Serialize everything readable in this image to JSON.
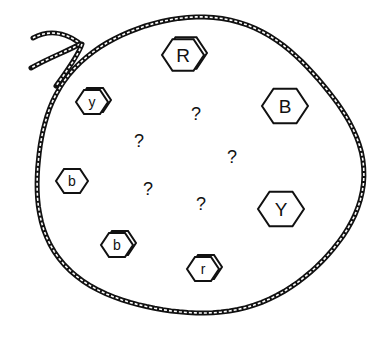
{
  "scene": {
    "title": "Bag of hexagonal tokens",
    "background": "#ffffff",
    "ink": "#111111"
  },
  "rope": {
    "color": "#111111",
    "highlight": "#ffffff",
    "center": [
      196,
      168
    ],
    "rx": 163,
    "ry": 148
  },
  "tokens": [
    {
      "id": "R",
      "label": "R",
      "x": 183,
      "y": 55,
      "size": 21,
      "double_edge": true,
      "font_size": 19
    },
    {
      "id": "y",
      "label": "y",
      "x": 92,
      "y": 102,
      "size": 16,
      "double_edge": true,
      "font_size": 14
    },
    {
      "id": "B",
      "label": "B",
      "x": 285,
      "y": 106,
      "size": 23,
      "double_edge": false,
      "font_size": 19
    },
    {
      "id": "b1",
      "label": "b",
      "x": 72,
      "y": 181,
      "size": 16,
      "double_edge": false,
      "font_size": 14
    },
    {
      "id": "Y",
      "label": "Y",
      "x": 281,
      "y": 209,
      "size": 23,
      "double_edge": false,
      "font_size": 19
    },
    {
      "id": "b2",
      "label": "b",
      "x": 117,
      "y": 245,
      "size": 16,
      "double_edge": true,
      "font_size": 14
    },
    {
      "id": "r",
      "label": "r",
      "x": 203,
      "y": 269,
      "size": 16,
      "double_edge": true,
      "font_size": 14
    }
  ],
  "unknowns": [
    {
      "label": "?",
      "x": 196,
      "y": 114
    },
    {
      "label": "?",
      "x": 139,
      "y": 141
    },
    {
      "label": "?",
      "x": 232,
      "y": 157
    },
    {
      "label": "?",
      "x": 148,
      "y": 189
    },
    {
      "label": "?",
      "x": 201,
      "y": 204
    }
  ]
}
